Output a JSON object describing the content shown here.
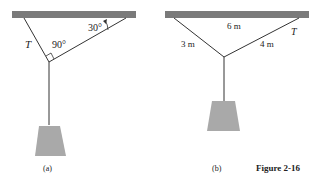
{
  "figure": {
    "caption": "Figure 2-16",
    "colors": {
      "ceiling": "#7a7a7a",
      "rope": "#333333",
      "weight": "#a9a9a9",
      "text": "#222222"
    }
  },
  "panel_a": {
    "label": "(a)",
    "tension_label": "T",
    "junction_angle_label": "90°",
    "ceiling_angle_label": "30°"
  },
  "panel_b": {
    "label": "(b)",
    "ceiling_length_label": "6 m",
    "left_rope_label": "3 m",
    "right_rope_label": "4 m",
    "tension_label": "T"
  }
}
